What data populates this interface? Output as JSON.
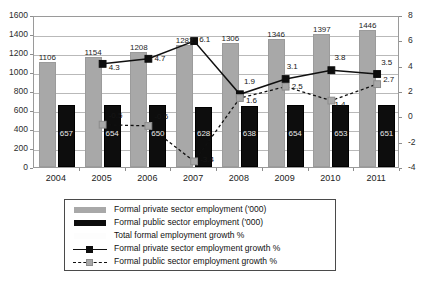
{
  "chart_data": {
    "type": "bar",
    "title": "",
    "subtitle": "",
    "xlabel": "",
    "ylabel": "",
    "categories": [
      "2004",
      "2005",
      "2006",
      "2007",
      "2008",
      "2009",
      "2010",
      "2011"
    ],
    "axes": {
      "left": {
        "label": "",
        "ylim": [
          0,
          1600
        ],
        "ticks": [
          0,
          200,
          400,
          600,
          800,
          1000,
          1200,
          1400,
          1600
        ],
        "tick_labels": [
          "0",
          "200",
          "400",
          "600",
          "800",
          "1000",
          "1200",
          "1400",
          "1600"
        ]
      },
      "right": {
        "label": "",
        "ylim": [
          -4,
          8
        ],
        "ticks": [
          -4,
          -2,
          0,
          2,
          4,
          6,
          8
        ],
        "tick_labels": [
          "-4",
          "-2",
          "0",
          "2",
          "4",
          "6",
          "8"
        ]
      }
    },
    "grid": true,
    "legend_position": "bottom",
    "series": [
      {
        "name": "Formal private sector employment ('000)",
        "kind": "bar",
        "axis": "left",
        "color": "#a8a8a8",
        "values": [
          1106,
          1154,
          1208,
          1282,
          1306,
          1346,
          1397,
          1446
        ],
        "labels": [
          "1106",
          "1154",
          "1208",
          "1282",
          "1306",
          "1346",
          "1397",
          "1446"
        ]
      },
      {
        "name": "Formal public sector employment ('000)",
        "kind": "bar",
        "axis": "left",
        "color": "#0d0d0d",
        "values": [
          657,
          654,
          650,
          628,
          638,
          654,
          653,
          651
        ],
        "labels": [
          "657",
          "654",
          "650",
          "628",
          "638",
          "654",
          "653",
          "651"
        ]
      },
      {
        "name": "Total formal employment growth %",
        "kind": "line",
        "axis": "right",
        "color": "#fdfdfd",
        "values": [
          null,
          null,
          null,
          null,
          null,
          null,
          null,
          null
        ],
        "labels": [
          "",
          "",
          "",
          "",
          "",
          "",
          "",
          ""
        ]
      },
      {
        "name": "Formal private sector employment growth %",
        "kind": "line-solid",
        "axis": "right",
        "color": "#101010",
        "values": [
          null,
          4.3,
          4.7,
          6.1,
          1.9,
          3.1,
          3.8,
          3.5
        ],
        "labels": [
          "",
          "4.3",
          "4.7",
          "6.1",
          "1.9",
          "3.1",
          "3.8",
          "3.5"
        ]
      },
      {
        "name": "Formal public sector employment growth %",
        "kind": "line-dashed",
        "axis": "right",
        "color": "#101010",
        "values": [
          null,
          -0.5,
          -0.6,
          -3.4,
          1.6,
          2.5,
          1.4,
          2.7
        ],
        "labels": [
          "",
          "-0.5",
          "-0.6",
          "-3.4",
          "1.6",
          "2.5",
          "1.4",
          "2.7"
        ]
      }
    ]
  },
  "legend": {
    "items": [
      {
        "key": "swatch-grey",
        "label": "Formal private sector employment ('000)"
      },
      {
        "key": "swatch-black",
        "label": "Formal public sector employment ('000)"
      },
      {
        "key": "swatch-blank",
        "label": "Total formal employment growth %"
      },
      {
        "key": "line-solid-marker-black",
        "label": "Formal private sector employment growth %"
      },
      {
        "key": "line-dashed-marker-grey",
        "label": "Formal public sector employment growth %"
      }
    ]
  },
  "footer": {
    "note": ""
  }
}
